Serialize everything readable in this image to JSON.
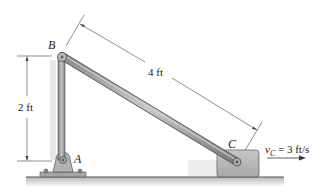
{
  "diagram": {
    "points": {
      "A": {
        "label": "A"
      },
      "B": {
        "label": "B"
      },
      "C": {
        "label": "C"
      }
    },
    "dimensions": {
      "height_AB": "2 ft",
      "length_BC": "4 ft"
    },
    "velocity": {
      "symbol": "v",
      "subscript": "C",
      "equals_value": " = 3 ft/s"
    },
    "colors": {
      "rod": "#9a9a9a",
      "block": "#b8b8b8",
      "ground": "#555555",
      "dimension_line": "#333333"
    }
  }
}
